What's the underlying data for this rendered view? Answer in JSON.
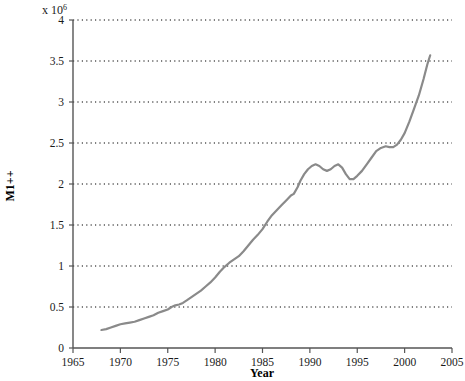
{
  "chart_data": {
    "type": "line",
    "title": "",
    "xlabel": "Year",
    "ylabel": "M1++",
    "y_multiplier_base": "x 10",
    "y_multiplier_exponent": "6",
    "y_multiplier_text": "x 10^6",
    "xlim": [
      1965,
      2005
    ],
    "ylim": [
      0,
      4
    ],
    "xticks": [
      1965,
      1970,
      1975,
      1980,
      1985,
      1990,
      1995,
      2000,
      2005
    ],
    "xtick_labels": [
      "1965",
      "1970",
      "1975",
      "1980",
      "1985",
      "1990",
      "1995",
      "2000",
      "2005"
    ],
    "yticks": [
      0,
      0.5,
      1,
      1.5,
      2,
      2.5,
      3,
      3.5,
      4
    ],
    "ytick_labels": [
      "0",
      "0.5",
      "1",
      "1.5",
      "2",
      "2.5",
      "3",
      "3.5",
      "4"
    ],
    "grid": "horizontal-dotted",
    "grid_color": "#000000",
    "legend": "none",
    "line_color": "#8a8a8a",
    "line_width": 2.2,
    "series": [
      {
        "name": "M1++",
        "x": [
          1968.0,
          1968.5,
          1969.0,
          1969.5,
          1970.0,
          1970.5,
          1971.0,
          1971.5,
          1972.0,
          1972.5,
          1973.0,
          1973.5,
          1974.0,
          1974.5,
          1975.0,
          1975.4,
          1975.8,
          1976.2,
          1976.6,
          1977.0,
          1977.5,
          1978.0,
          1978.5,
          1979.0,
          1979.5,
          1980.0,
          1980.5,
          1981.0,
          1981.5,
          1982.0,
          1982.5,
          1983.0,
          1983.5,
          1984.0,
          1984.5,
          1985.0,
          1985.5,
          1986.0,
          1986.5,
          1987.0,
          1987.5,
          1988.0,
          1988.3,
          1988.7,
          1989.0,
          1989.4,
          1989.8,
          1990.2,
          1990.6,
          1991.0,
          1991.4,
          1991.8,
          1992.2,
          1992.6,
          1993.0,
          1993.4,
          1993.8,
          1994.2,
          1994.6,
          1995.0,
          1995.5,
          1996.0,
          1996.5,
          1997.0,
          1997.5,
          1998.0,
          1998.4,
          1998.8,
          1999.2,
          1999.6,
          2000.0,
          2000.5,
          2001.0,
          2001.5,
          2002.0,
          2002.4,
          2002.7
        ],
        "y": [
          0.22,
          0.23,
          0.25,
          0.27,
          0.29,
          0.3,
          0.31,
          0.32,
          0.34,
          0.36,
          0.38,
          0.4,
          0.43,
          0.45,
          0.47,
          0.5,
          0.52,
          0.53,
          0.55,
          0.58,
          0.62,
          0.66,
          0.7,
          0.75,
          0.8,
          0.86,
          0.93,
          0.99,
          1.04,
          1.08,
          1.12,
          1.18,
          1.25,
          1.32,
          1.38,
          1.45,
          1.54,
          1.62,
          1.68,
          1.74,
          1.8,
          1.86,
          1.88,
          1.96,
          2.04,
          2.12,
          2.18,
          2.22,
          2.24,
          2.22,
          2.18,
          2.16,
          2.18,
          2.22,
          2.24,
          2.2,
          2.12,
          2.06,
          2.06,
          2.1,
          2.16,
          2.24,
          2.32,
          2.4,
          2.44,
          2.46,
          2.45,
          2.45,
          2.48,
          2.54,
          2.62,
          2.76,
          2.92,
          3.08,
          3.28,
          3.46,
          3.57
        ]
      }
    ]
  },
  "axes": {
    "x_axis_name": "Year",
    "y_axis_name": "M1++"
  }
}
